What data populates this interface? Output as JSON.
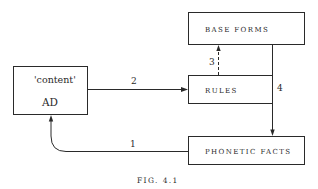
{
  "diagram": {
    "nodes": {
      "content_ad": {
        "top_label": "'content'",
        "bottom_label": "AD"
      },
      "base_forms": {
        "label": "BASE FORMS"
      },
      "rules": {
        "label": "RULES"
      },
      "phonetic_facts": {
        "label": "PHONETIC FACTS"
      }
    },
    "edges": {
      "e1": {
        "label": "1",
        "from": "PHONETIC FACTS",
        "to": "'content' AD",
        "style": "solid"
      },
      "e2": {
        "label": "2",
        "from": "'content' AD",
        "to": "RULES",
        "style": "solid"
      },
      "e3": {
        "label": "3",
        "from": "RULES",
        "to": "BASE FORMS",
        "style": "dashed"
      },
      "e4": {
        "label": "4",
        "from": "BASE FORMS",
        "to": "PHONETIC FACTS",
        "style": "solid"
      }
    },
    "caption": "FIG. 4.1",
    "colors": {
      "ink": "#2a2a2a",
      "background": "#ffffff"
    }
  }
}
